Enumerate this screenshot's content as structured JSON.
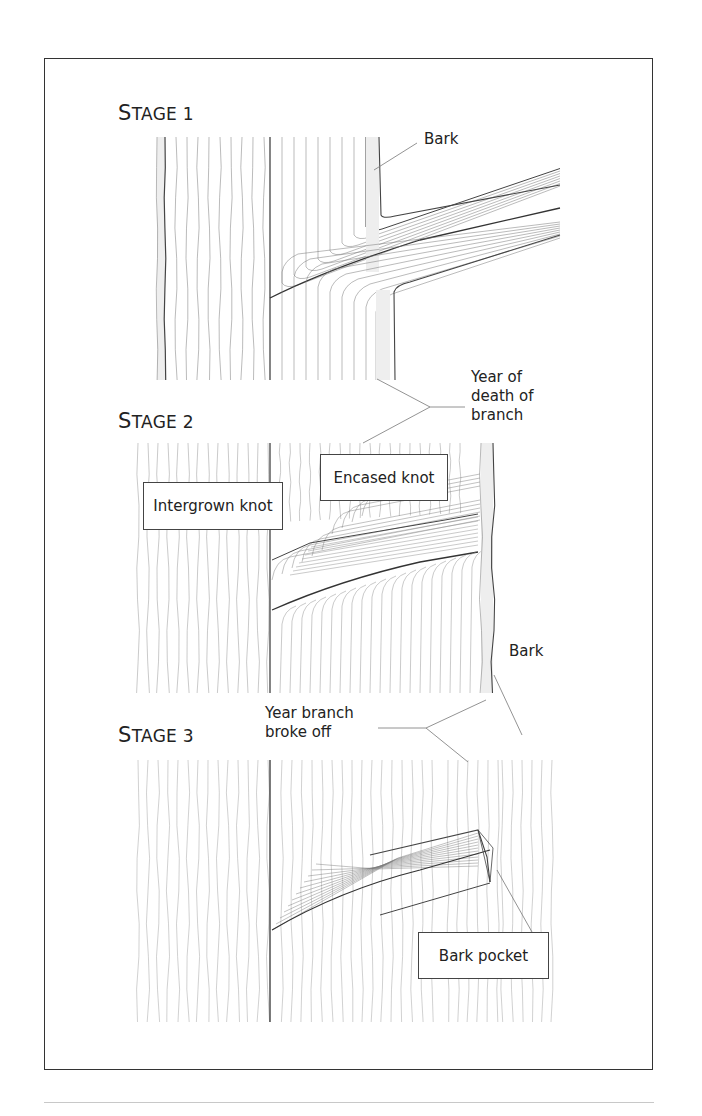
{
  "figure": {
    "stages": [
      {
        "id": 1,
        "title_cap": "S",
        "title_rest": "TAGE 1"
      },
      {
        "id": 2,
        "title_cap": "S",
        "title_rest": "TAGE 2"
      },
      {
        "id": 3,
        "title_cap": "S",
        "title_rest": "TAGE 3"
      }
    ],
    "labels": {
      "bark_stage1": "Bark",
      "year_of_death_line1": "Year of",
      "year_of_death_line2": "death of",
      "year_of_death_line3": "branch",
      "intergrown_knot": "Intergrown knot",
      "encased_knot": "Encased knot",
      "bark_stage2": "Bark",
      "year_broke_line1": "Year branch",
      "year_broke_line2": "broke off",
      "bark_pocket": "Bark pocket"
    },
    "colors": {
      "line": "#555555",
      "frame": "#333333",
      "bark_fill": "#ececec",
      "footer_rule": "#c8c8c8"
    }
  }
}
